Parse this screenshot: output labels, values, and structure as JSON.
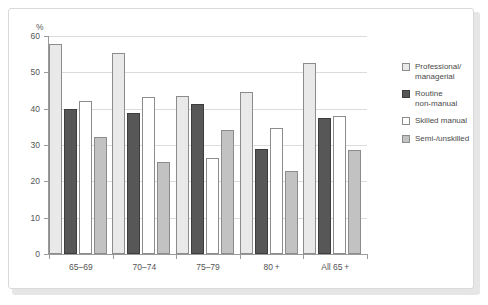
{
  "chart_data": {
    "type": "bar",
    "title": "",
    "subtitle": "",
    "xlabel": "",
    "ylabel": "%",
    "ylim": [
      0,
      60
    ],
    "ytick_values": [
      0,
      10,
      20,
      30,
      40,
      50,
      60
    ],
    "ytick_labels": [
      "0",
      "10",
      "20",
      "30",
      "40",
      "50",
      "60"
    ],
    "grid": true,
    "legend_position": "right",
    "categories": [
      "65–69",
      "70–74",
      "75–79",
      "80 +",
      "All 65 +"
    ],
    "series": [
      {
        "name": "Professional/\nmanagerial",
        "color": "#e9e9e9",
        "values": [
          57.8,
          55.2,
          43.5,
          44.5,
          52.5
        ]
      },
      {
        "name": "Routine\nnon-manual",
        "color": "#575757",
        "values": [
          40.0,
          38.8,
          41.3,
          29.0,
          37.3
        ]
      },
      {
        "name": "Skilled manual",
        "color": "#ffffff",
        "values": [
          42.0,
          43.3,
          26.5,
          34.8,
          38.0
        ]
      },
      {
        "name": "Semi-/unskilled",
        "color": "#c2c2c2",
        "values": [
          32.3,
          25.3,
          34.0,
          22.8,
          28.7
        ]
      }
    ]
  },
  "axis": {
    "y_unit_label": "%"
  }
}
